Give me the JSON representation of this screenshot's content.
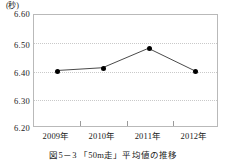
{
  "chart_data": {
    "type": "line",
    "title": "図5－3 「50m走」平均値の推移",
    "xlabel": "",
    "ylabel": "",
    "yunit": "(秒)",
    "categories": [
      "2009年",
      "2010年",
      "2011年",
      "2012年"
    ],
    "values": [
      6.4,
      6.41,
      6.48,
      6.4
    ],
    "series": [
      {
        "name": "50m走平均値",
        "values": [
          6.4,
          6.41,
          6.48,
          6.4
        ]
      }
    ],
    "ylim": [
      6.2,
      6.6
    ],
    "yticks": [
      "6.60",
      "6.50",
      "6.40",
      "6.30",
      "6.20"
    ],
    "ytick_values": [
      6.6,
      6.5,
      6.4,
      6.3,
      6.2
    ],
    "grid": "horizontal-dotted",
    "legend": "none",
    "marker": "filled-circle",
    "colors": {
      "line": "#333333",
      "marker": "#000000",
      "grid": "#c9c9c9",
      "frame": "#b9b9b9",
      "text": "#222222"
    }
  },
  "caption": {
    "text": "図5－3 「50m走」平均値の推移"
  }
}
